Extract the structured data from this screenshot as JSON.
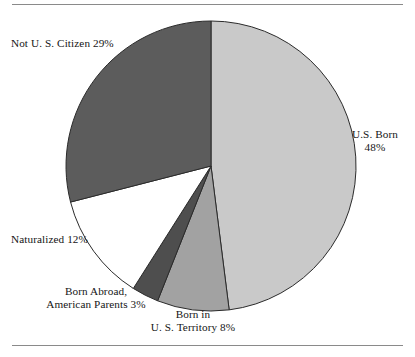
{
  "figure": {
    "has_top_rule": true,
    "has_bottom_rule": true,
    "rule_color": "#8a8a8a",
    "background": "#ffffff"
  },
  "chart_data": {
    "type": "pie",
    "title": "",
    "subtitle": "",
    "xlabel": "",
    "ylabel": "",
    "legend_position": "none",
    "grid": false,
    "units": "percent",
    "start_angle_deg": 0,
    "direction": "clockwise",
    "center": {
      "x": 211,
      "y": 166
    },
    "radius": 145,
    "categories": [
      "U.S. Born",
      "Born in U. S. Territory",
      "Born Abroad, American Parents",
      "Naturalized",
      "Not U. S. Citizen"
    ],
    "values": [
      48,
      8,
      3,
      12,
      29
    ],
    "colors": [
      "#c9c9c9",
      "#a2a2a2",
      "#4e4e4e",
      "#ffffff",
      "#5c5c5c"
    ],
    "slices": [
      {
        "name": "us-born",
        "label_line1": "U.S. Born",
        "label_line2": "48%",
        "value": 48,
        "color": "#c9c9c9"
      },
      {
        "name": "born-in-us-territory",
        "label_line1": "Born in",
        "label_line2": "U. S. Territory 8%",
        "value": 8,
        "color": "#a2a2a2"
      },
      {
        "name": "born-abroad-american-parents",
        "label_line1": "Born Abroad,",
        "label_line2": "American Parents 3%",
        "value": 3,
        "color": "#4e4e4e"
      },
      {
        "name": "naturalized",
        "label_line1": "Naturalized 12%",
        "label_line2": "",
        "value": 12,
        "color": "#ffffff"
      },
      {
        "name": "not-us-citizen",
        "label_line1": "Not U. S. Citizen 29%",
        "label_line2": "",
        "value": 29,
        "color": "#5c5c5c"
      }
    ]
  }
}
